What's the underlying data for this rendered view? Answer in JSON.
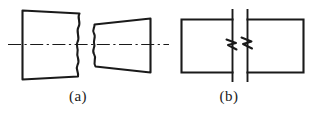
{
  "figure": {
    "kind": "engineering-drawing",
    "background_color": "#ffffff",
    "line_color": "#1a1a1a",
    "caption_color": "#1a1a1a",
    "width": 317,
    "height": 114
  },
  "subfigures": [
    {
      "id": "a",
      "caption": "(a)",
      "break_type": "wavy-break",
      "centerline": {
        "present": true,
        "style": "dash-dot",
        "y": 44,
        "x_start": 8,
        "x_end": 169
      },
      "parts": [
        {
          "name": "left-shaft-segment",
          "shape": "rectangle-with-wavy-right-edge",
          "x_left": 22,
          "x_right": 79,
          "y_top": 10,
          "y_bottom": 80
        },
        {
          "name": "right-tapered-segment",
          "shape": "trapezoid-with-wavy-left-edge",
          "x_left": 93,
          "x_right": 150,
          "y_top_left": 24,
          "y_bottom_left": 66,
          "y_top_right": 18,
          "y_bottom_right": 72
        }
      ]
    },
    {
      "id": "b",
      "caption": "(b)",
      "break_type": "zigzag-break",
      "centerline": {
        "present": false
      },
      "parts": [
        {
          "name": "left-bar-segment",
          "shape": "rectangle",
          "x_left": 181,
          "x_right": 232,
          "y_top": 19,
          "y_bottom": 72
        },
        {
          "name": "right-bar-segment",
          "shape": "rectangle",
          "x_left": 247,
          "x_right": 303,
          "y_top": 19,
          "y_bottom": 72
        },
        {
          "name": "break-boundary-left",
          "shape": "vertical-line",
          "x": 232,
          "y_top": 9,
          "y_bottom": 82
        },
        {
          "name": "break-boundary-right",
          "shape": "vertical-line",
          "x": 247,
          "y_top": 9,
          "y_bottom": 82
        },
        {
          "name": "zigzag-break-symbol",
          "shape": "double-s-zigzag",
          "y_center": 44
        }
      ]
    }
  ]
}
